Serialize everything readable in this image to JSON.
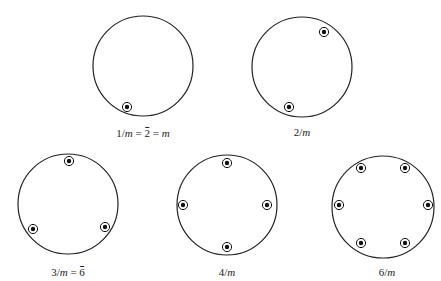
{
  "diagram": {
    "line_color": "#222222",
    "marker_color": "#111111",
    "projections": [
      {
        "id": "1m",
        "label_parts": {
          "a": "1/",
          "b": "m",
          "c": " = ",
          "d": "2",
          "e": " = ",
          "f": "m"
        },
        "label_text": "1/m = 2̄ = m",
        "circle": {
          "cx": 143,
          "cy": 66,
          "r": 50
        },
        "label_pos": {
          "x": 143,
          "y": 127
        },
        "markers": [
          {
            "x": 127,
            "y": 107
          }
        ]
      },
      {
        "id": "2m",
        "label_parts": {
          "a": "2/",
          "b": "m"
        },
        "label_text": "2/m",
        "circle": {
          "cx": 302,
          "cy": 67,
          "r": 50
        },
        "label_pos": {
          "x": 302,
          "y": 126
        },
        "markers": [
          {
            "x": 324,
            "y": 32
          },
          {
            "x": 289,
            "y": 107
          }
        ]
      },
      {
        "id": "3m",
        "label_parts": {
          "a": "3/",
          "b": "m",
          "c": " = ",
          "d": "6"
        },
        "label_text": "3/m = 6̄",
        "circle": {
          "cx": 68,
          "cy": 204,
          "r": 50
        },
        "label_pos": {
          "x": 68,
          "y": 266
        },
        "markers": [
          {
            "x": 69,
            "y": 161
          },
          {
            "x": 33,
            "y": 229
          },
          {
            "x": 105,
            "y": 227
          }
        ]
      },
      {
        "id": "4m",
        "label_parts": {
          "a": "4/",
          "b": "m"
        },
        "label_text": "4/m",
        "circle": {
          "cx": 227,
          "cy": 205,
          "r": 50
        },
        "label_pos": {
          "x": 227,
          "y": 266
        },
        "markers": [
          {
            "x": 227,
            "y": 163
          },
          {
            "x": 183,
            "y": 205
          },
          {
            "x": 267,
            "y": 205
          },
          {
            "x": 227,
            "y": 247
          }
        ]
      },
      {
        "id": "6m",
        "label_parts": {
          "a": "6/",
          "b": "m"
        },
        "label_text": "6/m",
        "circle": {
          "cx": 383,
          "cy": 207,
          "r": 51
        },
        "label_pos": {
          "x": 387,
          "y": 266
        },
        "markers": [
          {
            "x": 361,
            "y": 168
          },
          {
            "x": 405,
            "y": 168
          },
          {
            "x": 339,
            "y": 205
          },
          {
            "x": 428,
            "y": 205
          },
          {
            "x": 361,
            "y": 243
          },
          {
            "x": 405,
            "y": 243
          }
        ]
      }
    ]
  }
}
